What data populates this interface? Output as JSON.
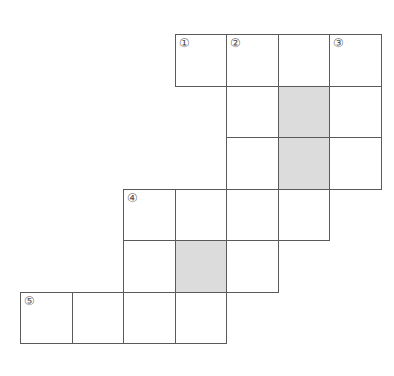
{
  "puzzle": {
    "type": "crossword-grid",
    "cell_size": 51.5,
    "origin": {
      "x": 20,
      "y": 34
    },
    "colors": {
      "line": "#5a5a5a",
      "shaded": "#dcdcdc",
      "background": "#ffffff"
    },
    "cells": [
      {
        "row": 0,
        "col": 3,
        "label": "①",
        "shaded": false
      },
      {
        "row": 0,
        "col": 4,
        "label": "②",
        "shaded": false
      },
      {
        "row": 0,
        "col": 5,
        "label": "",
        "shaded": false
      },
      {
        "row": 0,
        "col": 6,
        "label": "③",
        "shaded": false
      },
      {
        "row": 1,
        "col": 4,
        "label": "",
        "shaded": false
      },
      {
        "row": 1,
        "col": 5,
        "label": "",
        "shaded": true
      },
      {
        "row": 1,
        "col": 6,
        "label": "",
        "shaded": false
      },
      {
        "row": 2,
        "col": 4,
        "label": "",
        "shaded": false
      },
      {
        "row": 2,
        "col": 5,
        "label": "",
        "shaded": true
      },
      {
        "row": 2,
        "col": 6,
        "label": "",
        "shaded": false
      },
      {
        "row": 3,
        "col": 2,
        "label": "④",
        "shaded": false
      },
      {
        "row": 3,
        "col": 3,
        "label": "",
        "shaded": false
      },
      {
        "row": 3,
        "col": 4,
        "label": "",
        "shaded": false
      },
      {
        "row": 3,
        "col": 5,
        "label": "",
        "shaded": false
      },
      {
        "row": 4,
        "col": 2,
        "label": "",
        "shaded": false
      },
      {
        "row": 4,
        "col": 3,
        "label": "",
        "shaded": true
      },
      {
        "row": 4,
        "col": 4,
        "label": "",
        "shaded": false
      },
      {
        "row": 5,
        "col": 0,
        "label": "⑤",
        "shaded": false
      },
      {
        "row": 5,
        "col": 1,
        "label": "",
        "shaded": false
      },
      {
        "row": 5,
        "col": 2,
        "label": "",
        "shaded": false
      },
      {
        "row": 5,
        "col": 3,
        "label": "",
        "shaded": false
      }
    ]
  }
}
